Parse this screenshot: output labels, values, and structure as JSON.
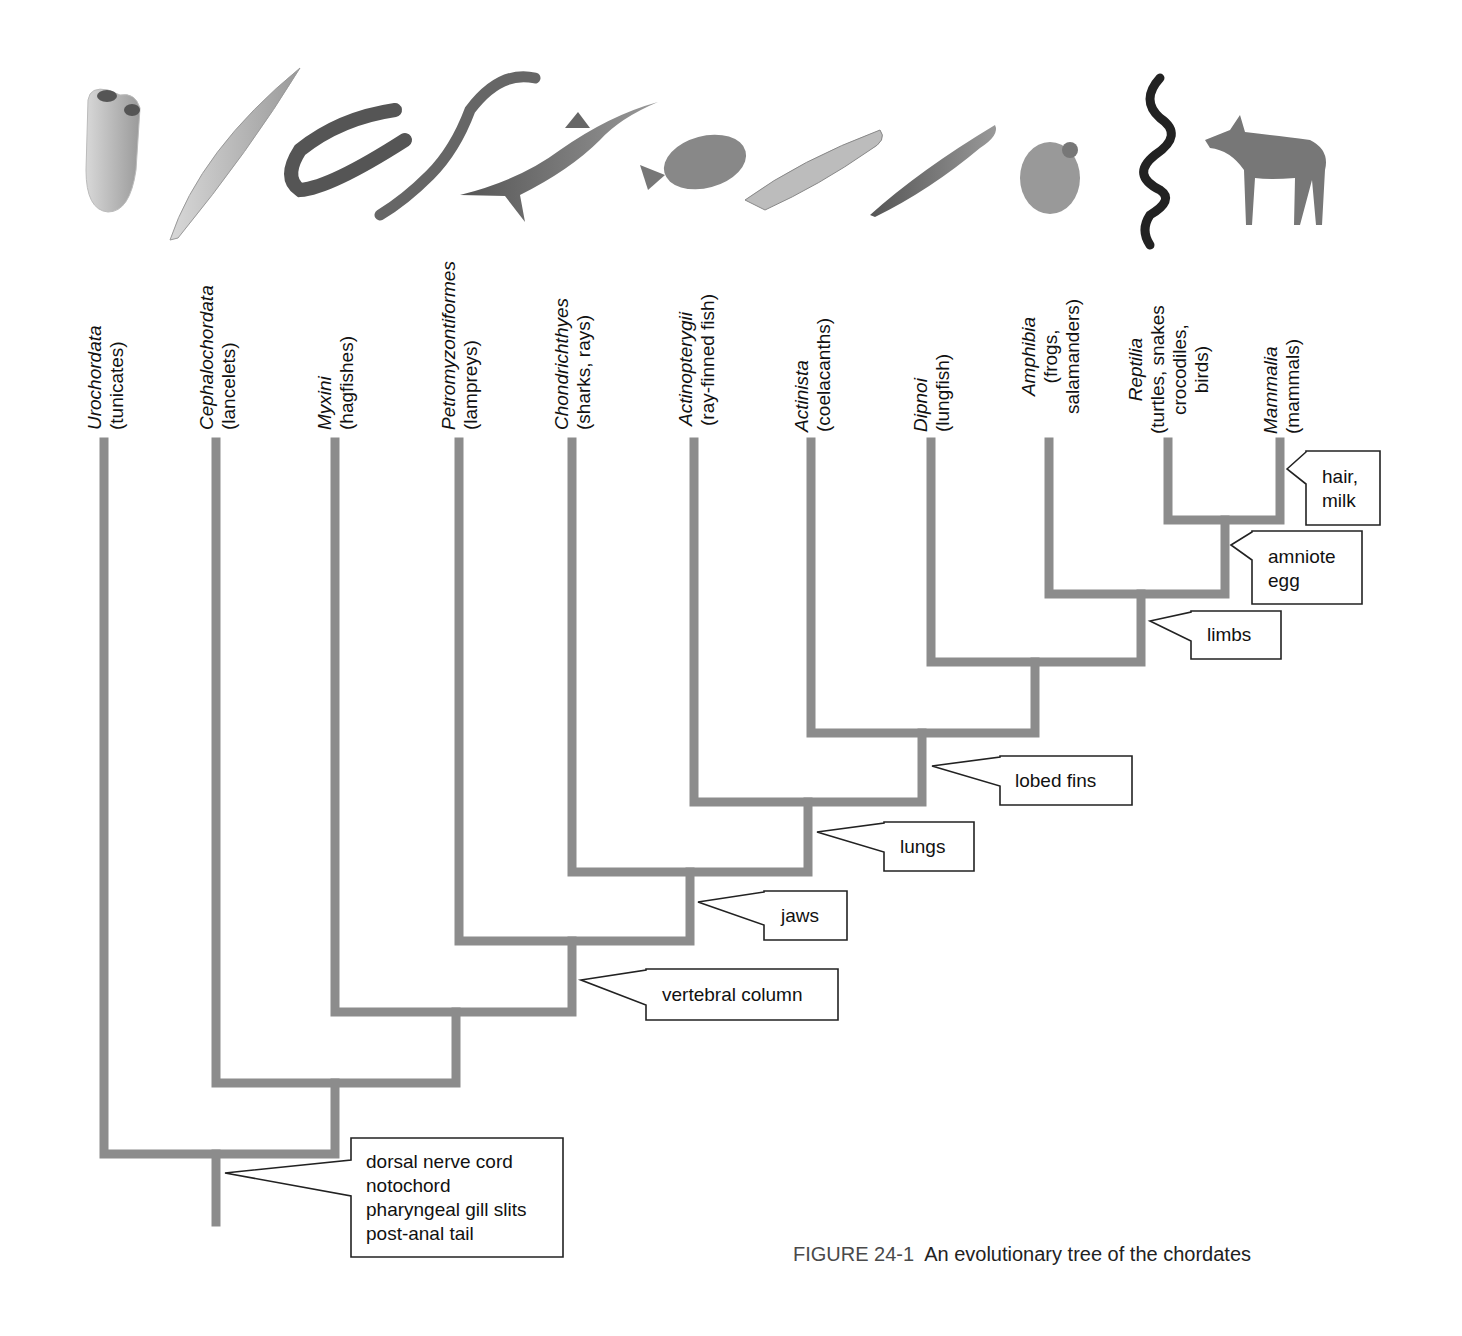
{
  "figure": {
    "number_label": "FIGURE 24-1",
    "title": "An evolutionary tree of the chordates"
  },
  "colors": {
    "branch": "#8c8c8c",
    "callout_border": "#222222",
    "text": "#111111",
    "caption_number": "#4a4a4a"
  },
  "taxa": [
    {
      "scientific": "Urochordata",
      "common": "(tunicates)",
      "animal_icon": "tunicate-icon"
    },
    {
      "scientific": "Cephalochordata",
      "common": "(lancelets)",
      "animal_icon": "lancelet-icon"
    },
    {
      "scientific": "Myxini",
      "common": "(hagfishes)",
      "animal_icon": "hagfish-icon"
    },
    {
      "scientific": "Petromyzontiformes",
      "common": "(lampreys)",
      "animal_icon": "lamprey-icon"
    },
    {
      "scientific": "Chondrichthyes",
      "common": "(sharks, rays)",
      "animal_icon": "shark-icon"
    },
    {
      "scientific": "Actinopterygii",
      "common": "(ray-finned fish)",
      "animal_icon": "sunfish-icon"
    },
    {
      "scientific": "Actinista",
      "common": "(coelacanths)",
      "animal_icon": "coelacanth-icon"
    },
    {
      "scientific": "Dipnoi",
      "common": "(lungfish)",
      "animal_icon": "lungfish-icon"
    },
    {
      "scientific": "Amphibia",
      "common": "(frogs,",
      "common2": "salamanders)",
      "animal_icon": "frog-icon"
    },
    {
      "scientific": "Reptilia",
      "common": "(turtles, snakes",
      "common2": "crocodiles,",
      "common3": "birds)",
      "animal_icon": "snake-icon"
    },
    {
      "scientific": "Mammalia",
      "common": "(mammals)",
      "animal_icon": "deer-icon"
    }
  ],
  "traits": [
    {
      "id": "chordate",
      "lines": "dorsal nerve cord\nnotochord\npharyngeal gill slits\npost-anal tail"
    },
    {
      "id": "vertebral",
      "lines": "vertebral column"
    },
    {
      "id": "jaws",
      "lines": "jaws"
    },
    {
      "id": "lungs",
      "lines": "lungs"
    },
    {
      "id": "lobed",
      "lines": "lobed fins"
    },
    {
      "id": "limbs",
      "lines": "limbs"
    },
    {
      "id": "amniote",
      "lines": "amniote\negg"
    },
    {
      "id": "hair",
      "lines": "hair,\nmilk"
    }
  ]
}
